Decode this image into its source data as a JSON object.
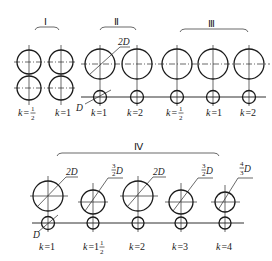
{
  "figure": {
    "groups": [
      {
        "id": "I",
        "label": "Ⅰ",
        "items": [
          {
            "k": "1/2"
          },
          {
            "k": "1"
          }
        ]
      },
      {
        "id": "II",
        "label": "Ⅱ",
        "items": [
          {
            "k": "1"
          },
          {
            "k": "2"
          }
        ],
        "dims": {
          "large": "2D",
          "small": "D"
        }
      },
      {
        "id": "III",
        "label": "Ⅲ",
        "items": [
          {
            "k": "1/2"
          },
          {
            "k": "1"
          },
          {
            "k": "2"
          }
        ]
      },
      {
        "id": "IV",
        "label": "Ⅳ",
        "items": [
          {
            "k": "1",
            "dim": "2D"
          },
          {
            "k": "1 1/2",
            "dim": "3/2 D"
          },
          {
            "k": "2",
            "dim": "2D"
          },
          {
            "k": "3",
            "dim": "3/2 D"
          },
          {
            "k": "4",
            "dim": "4/3 D"
          }
        ],
        "small_dim": "D"
      }
    ],
    "text": {
      "k_prefix": "k=",
      "k_eq": "=",
      "k_var": "k",
      "one": "1",
      "two": "2",
      "three": "3",
      "four": "4",
      "half_num": "1",
      "half_den": "2",
      "three_num": "3",
      "two_den": "2",
      "four_num": "4",
      "three_den": "3",
      "D": "D",
      "twoD": "2D",
      "roman_I": "Ⅰ",
      "roman_II": "Ⅱ",
      "roman_III": "Ⅲ",
      "roman_IV": "Ⅳ"
    }
  }
}
